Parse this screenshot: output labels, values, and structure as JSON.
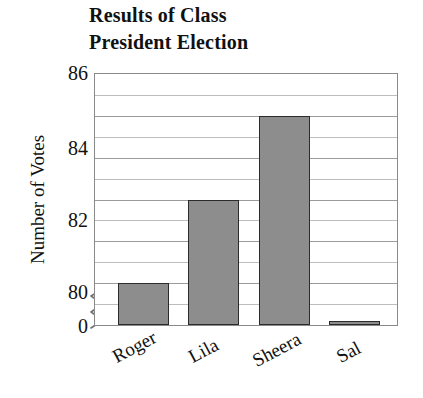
{
  "chart_data": {
    "type": "bar",
    "title": "Results of Class President Election",
    "title_lines": [
      "Results of Class",
      "President Election"
    ],
    "xlabel": "",
    "ylabel": "Number of Votes",
    "categories": [
      "Roger",
      "Lila",
      "Sheera",
      "Sal"
    ],
    "values": [
      81,
      83,
      85,
      80.1
    ],
    "ylim": [
      80,
      86
    ],
    "y_ticks": [
      0,
      80,
      82,
      84,
      86
    ],
    "y_tick_labels": [
      "0",
      "80",
      "82",
      "84",
      "86"
    ],
    "y_minor_tick_step": 0.5,
    "axis_break": true,
    "axis_break_between": [
      0,
      80
    ],
    "grid": true,
    "legend": false,
    "bar_fill_color": "#8d8d8d",
    "bar_edge_color": "#2b2b2b",
    "grid_color": "#9b9b9b",
    "frame_color": "#8a8a8a",
    "background_color": "#ffffff",
    "text_color": "#111111"
  },
  "axis": {
    "y_title": "Number of Votes",
    "tick_0": "0",
    "tick_80": "80",
    "tick_82": "82",
    "tick_84": "84",
    "tick_86": "86"
  },
  "bars": [
    {
      "label": "Roger",
      "value": 81
    },
    {
      "label": "Lila",
      "value": 83
    },
    {
      "label": "Sheera",
      "value": 85
    },
    {
      "label": "Sal",
      "value": 80.1
    }
  ]
}
